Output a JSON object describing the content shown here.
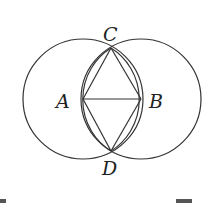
{
  "diagram": {
    "points": {
      "A": {
        "label": "A",
        "x": 83,
        "y": 99
      },
      "B": {
        "label": "B",
        "x": 141,
        "y": 99
      },
      "C": {
        "label": "C",
        "x": 111,
        "y": 48
      },
      "D": {
        "label": "D",
        "x": 111,
        "y": 151
      }
    },
    "circles": [
      {
        "center": "A",
        "radius": 60
      },
      {
        "center": "B",
        "radius": 60
      }
    ],
    "segments": [
      "AB",
      "AC",
      "BC",
      "AD",
      "BD"
    ],
    "stroke_color": "#333333"
  }
}
